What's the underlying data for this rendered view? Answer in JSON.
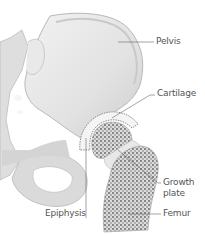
{
  "diagram": {
    "top_caption_partial": "ng · ·hy · ·",
    "labels": {
      "pelvis": "Pelvis",
      "cartilage": "Cartilage",
      "growth_plate_line1": "Growth",
      "growth_plate_line2": "plate",
      "epiphysis": "Epiphysis",
      "femur": "Femur"
    },
    "colors": {
      "bone": "#e4e4e4",
      "bone_shade": "#cfcfcf",
      "outline": "#b5b5b5",
      "trabecular_dots": "#6a6a6a",
      "leader_line": "#666666",
      "label_text": "#555555"
    }
  }
}
